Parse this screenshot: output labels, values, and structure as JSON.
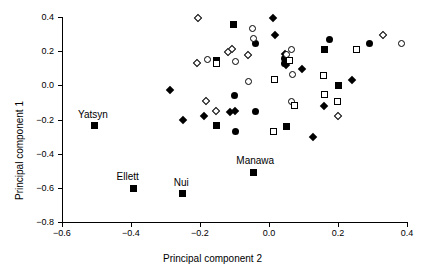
{
  "chart_data": {
    "type": "scatter",
    "title": "",
    "xlabel": "Principal component 2",
    "ylabel": "Principal component 1",
    "xlim": [
      -0.6,
      0.4
    ],
    "ylim": [
      -0.8,
      0.4
    ],
    "xticks": [
      "-0.6",
      "-0.4",
      "-0.2",
      "0.0",
      "0.2",
      "0.4"
    ],
    "xtick_values": [
      -0.6,
      -0.4,
      -0.2,
      0.0,
      0.2,
      0.4
    ],
    "yticks": [
      "0.4",
      "0.2",
      "0.0",
      "-0.2",
      "-0.4",
      "-0.6",
      "-0.8"
    ],
    "ytick_values": [
      0.4,
      0.2,
      0.0,
      -0.2,
      -0.4,
      -0.6,
      -0.8
    ],
    "grid": false,
    "legend": "none",
    "marker_styles": [
      "filled-square",
      "open-square",
      "filled-circle",
      "open-circle",
      "filled-diamond",
      "open-diamond"
    ],
    "color": "#000000",
    "points": [
      {
        "x": -0.505,
        "y": -0.238,
        "marker": "filled-square",
        "label": "Yatsyn"
      },
      {
        "x": -0.393,
        "y": -0.602,
        "marker": "filled-square",
        "label": "Ellett"
      },
      {
        "x": -0.252,
        "y": -0.635,
        "marker": "filled-square",
        "label": "Nui"
      },
      {
        "x": -0.046,
        "y": -0.508,
        "marker": "filled-square",
        "label": "Manawa"
      },
      {
        "x": -0.288,
        "y": -0.025,
        "marker": "filled-diamond",
        "label": ""
      },
      {
        "x": -0.25,
        "y": -0.205,
        "marker": "filled-diamond",
        "label": ""
      },
      {
        "x": -0.188,
        "y": -0.178,
        "marker": "filled-diamond",
        "label": ""
      },
      {
        "x": -0.113,
        "y": -0.155,
        "marker": "filled-diamond",
        "label": ""
      },
      {
        "x": -0.098,
        "y": -0.152,
        "marker": "filled-diamond",
        "label": ""
      },
      {
        "x": 0.013,
        "y": 0.395,
        "marker": "filled-diamond",
        "label": ""
      },
      {
        "x": 0.018,
        "y": 0.296,
        "marker": "filled-diamond",
        "label": ""
      },
      {
        "x": 0.046,
        "y": 0.183,
        "marker": "filled-diamond",
        "label": ""
      },
      {
        "x": 0.048,
        "y": 0.118,
        "marker": "filled-diamond",
        "label": ""
      },
      {
        "x": 0.096,
        "y": 0.094,
        "marker": "filled-diamond",
        "label": ""
      },
      {
        "x": 0.128,
        "y": -0.305,
        "marker": "filled-diamond",
        "label": ""
      },
      {
        "x": 0.16,
        "y": -0.122,
        "marker": "filled-diamond",
        "label": ""
      },
      {
        "x": 0.24,
        "y": 0.032,
        "marker": "filled-diamond",
        "label": ""
      },
      {
        "x": -0.152,
        "y": 0.148,
        "marker": "filled-square",
        "label": ""
      },
      {
        "x": -0.102,
        "y": 0.358,
        "marker": "filled-square",
        "label": ""
      },
      {
        "x": -0.152,
        "y": -0.238,
        "marker": "filled-square",
        "label": ""
      },
      {
        "x": 0.052,
        "y": -0.24,
        "marker": "filled-square",
        "label": ""
      },
      {
        "x": 0.162,
        "y": 0.21,
        "marker": "filled-square",
        "label": ""
      },
      {
        "x": 0.2,
        "y": 0.0,
        "marker": "filled-square",
        "label": ""
      },
      {
        "x": -0.1,
        "y": -0.06,
        "marker": "filled-circle",
        "label": ""
      },
      {
        "x": -0.098,
        "y": -0.268,
        "marker": "filled-circle",
        "label": ""
      },
      {
        "x": -0.04,
        "y": 0.246,
        "marker": "filled-circle",
        "label": ""
      },
      {
        "x": -0.04,
        "y": -0.155,
        "marker": "filled-circle",
        "label": ""
      },
      {
        "x": 0.046,
        "y": 0.158,
        "marker": "filled-circle",
        "label": ""
      },
      {
        "x": 0.046,
        "y": 0.128,
        "marker": "filled-circle",
        "label": ""
      },
      {
        "x": 0.175,
        "y": 0.268,
        "marker": "filled-circle",
        "label": ""
      },
      {
        "x": 0.29,
        "y": 0.242,
        "marker": "filled-circle",
        "label": ""
      },
      {
        "x": -0.208,
        "y": 0.128,
        "marker": "open-diamond",
        "label": ""
      },
      {
        "x": -0.205,
        "y": 0.394,
        "marker": "open-diamond",
        "label": ""
      },
      {
        "x": -0.118,
        "y": 0.196,
        "marker": "open-diamond",
        "label": ""
      },
      {
        "x": -0.108,
        "y": 0.21,
        "marker": "open-diamond",
        "label": ""
      },
      {
        "x": -0.183,
        "y": -0.092,
        "marker": "open-diamond",
        "label": ""
      },
      {
        "x": -0.155,
        "y": -0.148,
        "marker": "open-diamond",
        "label": ""
      },
      {
        "x": -0.062,
        "y": 0.178,
        "marker": "open-diamond",
        "label": ""
      },
      {
        "x": 0.2,
        "y": -0.178,
        "marker": "open-diamond",
        "label": ""
      },
      {
        "x": 0.33,
        "y": 0.296,
        "marker": "open-diamond",
        "label": ""
      },
      {
        "x": -0.178,
        "y": 0.154,
        "marker": "open-circle",
        "label": ""
      },
      {
        "x": -0.098,
        "y": 0.142,
        "marker": "open-circle",
        "label": ""
      },
      {
        "x": -0.048,
        "y": 0.332,
        "marker": "open-circle",
        "label": ""
      },
      {
        "x": -0.046,
        "y": 0.272,
        "marker": "open-circle",
        "label": ""
      },
      {
        "x": -0.058,
        "y": 0.022,
        "marker": "open-circle",
        "label": ""
      },
      {
        "x": 0.052,
        "y": 0.178,
        "marker": "open-circle",
        "label": ""
      },
      {
        "x": 0.065,
        "y": 0.21,
        "marker": "open-circle",
        "label": ""
      },
      {
        "x": 0.068,
        "y": 0.062,
        "marker": "open-circle",
        "label": ""
      },
      {
        "x": 0.065,
        "y": -0.092,
        "marker": "open-circle",
        "label": ""
      },
      {
        "x": 0.385,
        "y": 0.244,
        "marker": "open-circle",
        "label": ""
      },
      {
        "x": -0.152,
        "y": 0.128,
        "marker": "open-square",
        "label": ""
      },
      {
        "x": 0.058,
        "y": 0.145,
        "marker": "open-square",
        "label": ""
      },
      {
        "x": 0.015,
        "y": 0.032,
        "marker": "open-square",
        "label": ""
      },
      {
        "x": 0.012,
        "y": -0.272,
        "marker": "open-square",
        "label": ""
      },
      {
        "x": 0.075,
        "y": -0.118,
        "marker": "open-square",
        "label": ""
      },
      {
        "x": 0.158,
        "y": 0.06,
        "marker": "open-square",
        "label": ""
      },
      {
        "x": 0.16,
        "y": -0.055,
        "marker": "open-square",
        "label": ""
      },
      {
        "x": 0.198,
        "y": -0.092,
        "marker": "open-square",
        "label": ""
      },
      {
        "x": 0.255,
        "y": 0.21,
        "marker": "open-square",
        "label": ""
      }
    ]
  }
}
